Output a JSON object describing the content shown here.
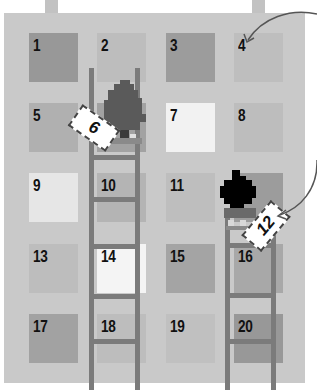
{
  "board": {
    "background": "#c9c9c9",
    "squares": [
      {
        "n": "1",
        "x": 29,
        "y": 33,
        "color": "#989898"
      },
      {
        "n": "2",
        "x": 97,
        "y": 33,
        "color": "#bdbdbd"
      },
      {
        "n": "3",
        "x": 166,
        "y": 33,
        "color": "#9c9c9c"
      },
      {
        "n": "4",
        "x": 234,
        "y": 33,
        "color": "#bebebe"
      },
      {
        "n": "5",
        "x": 29,
        "y": 103,
        "color": "#b0b0b0"
      },
      {
        "n": "6",
        "x": 97,
        "y": 103,
        "color": "#a2a2a2"
      },
      {
        "n": "7",
        "x": 166,
        "y": 103,
        "color": "#f2f2f2"
      },
      {
        "n": "8",
        "x": 234,
        "y": 103,
        "color": "#bdbdbd"
      },
      {
        "n": "9",
        "x": 29,
        "y": 173,
        "color": "#e6e6e6"
      },
      {
        "n": "10",
        "x": 97,
        "y": 173,
        "color": "#b4b4b4"
      },
      {
        "n": "11",
        "x": 166,
        "y": 173,
        "color": "#bebebe"
      },
      {
        "n": "12",
        "x": 234,
        "y": 173,
        "color": "#9c9c9c"
      },
      {
        "n": "13",
        "x": 29,
        "y": 244,
        "color": "#bdbdbd"
      },
      {
        "n": "14",
        "x": 97,
        "y": 244,
        "color": "#f4f4f4"
      },
      {
        "n": "15",
        "x": 166,
        "y": 244,
        "color": "#a4a4a4"
      },
      {
        "n": "16",
        "x": 234,
        "y": 244,
        "color": "#a8a8a8"
      },
      {
        "n": "17",
        "x": 29,
        "y": 314,
        "color": "#a2a2a2"
      },
      {
        "n": "18",
        "x": 97,
        "y": 314,
        "color": "#bdbdbd"
      },
      {
        "n": "19",
        "x": 166,
        "y": 314,
        "color": "#c0c0c0"
      },
      {
        "n": "20",
        "x": 234,
        "y": 314,
        "color": "#989898"
      }
    ]
  },
  "labels": {
    "tag_left": "6",
    "tag_right": "12"
  },
  "colors": {
    "ladder": "#7b7b7b",
    "tree": "#5a5a5a",
    "bush": "#000000",
    "arrow": "#555555"
  }
}
